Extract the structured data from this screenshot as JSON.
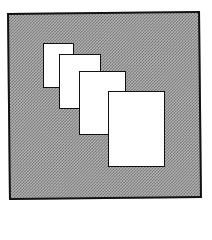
{
  "image": {
    "description": "Dithered icon of stacked overlapping pages on a gray background frame",
    "icon": "stacked-pages-icon",
    "colors": {
      "background": "#ffffff",
      "frame_border": "#111111",
      "dither_light": "#b8b8b8",
      "dither_dark": "#6a6a6a",
      "sheet_fill": "#ffffff"
    },
    "sheets": [
      {
        "name": "sheet-1",
        "left": 43,
        "top": 43,
        "width": 31,
        "height": 45
      },
      {
        "name": "sheet-2",
        "left": 59,
        "top": 54,
        "width": 42,
        "height": 55
      },
      {
        "name": "sheet-3",
        "left": 79,
        "top": 71,
        "width": 47,
        "height": 64
      },
      {
        "name": "sheet-4",
        "left": 108,
        "top": 91,
        "width": 57,
        "height": 76
      }
    ]
  }
}
